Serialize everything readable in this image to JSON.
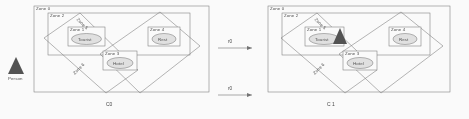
{
  "diagram": {
    "type": "state-transition-zone-diagram",
    "states": [
      {
        "id": "C0",
        "caption": "C0",
        "actor": {
          "name": "Person",
          "label": "Person",
          "icon": "triangle-person-icon",
          "location": "outside",
          "shaded": true
        },
        "zones": [
          {
            "id": "zone0",
            "label": "Zone 0",
            "shape": "rectangle",
            "role": "outer-container"
          },
          {
            "id": "zone2",
            "label": "Zone 2",
            "shape": "rectangle",
            "role": "inner-container"
          },
          {
            "id": "zone5",
            "label": "Zone 5",
            "shape": "diamond",
            "role": "rotated-region"
          },
          {
            "id": "zone6",
            "label": "Zone 6",
            "shape": "diamond",
            "role": "rotated-region"
          },
          {
            "id": "zone1",
            "label": "Zone 1",
            "shape": "rectangle",
            "entity": "Tourist"
          },
          {
            "id": "zone4",
            "label": "Zone 4",
            "shape": "rectangle",
            "entity": "Rest"
          },
          {
            "id": "zone3",
            "label": "Zone 3",
            "shape": "rectangle",
            "entity": "Hotel"
          }
        ],
        "entities": [
          {
            "id": "tourist",
            "label": "Tourist",
            "shape": "ellipse",
            "zone": "Zone 1"
          },
          {
            "id": "rest",
            "label": "Rest",
            "shape": "ellipse",
            "zone": "Zone 4"
          },
          {
            "id": "hotel",
            "label": "Hotel",
            "shape": "ellipse",
            "zone": "Zone 3"
          }
        ]
      },
      {
        "id": "C1",
        "caption": "C 1",
        "actor": {
          "name": "Person",
          "label": "Person",
          "icon": "triangle-person-icon",
          "location": "Zone 1 / Tourist",
          "shaded": true
        },
        "zones": [
          {
            "id": "zone0",
            "label": "Zone 0",
            "shape": "rectangle",
            "role": "outer-container"
          },
          {
            "id": "zone2",
            "label": "Zone 2",
            "shape": "rectangle",
            "role": "inner-container"
          },
          {
            "id": "zone5",
            "label": "Zone 5",
            "shape": "diamond",
            "role": "rotated-region"
          },
          {
            "id": "zone6",
            "label": "Zone 6",
            "shape": "diamond",
            "role": "rotated-region"
          },
          {
            "id": "zone1",
            "label": "Zone 1",
            "shape": "rectangle",
            "entity": "Tourist"
          },
          {
            "id": "zone4",
            "label": "Zone 4",
            "shape": "rectangle",
            "entity": "Rest"
          },
          {
            "id": "zone3",
            "label": "Zone 3",
            "shape": "rectangle",
            "entity": "Hotel"
          }
        ],
        "entities": [
          {
            "id": "tourist",
            "label": "Tourist",
            "shape": "ellipse",
            "zone": "Zone 1"
          },
          {
            "id": "rest",
            "label": "Rest",
            "shape": "ellipse",
            "zone": "Zone 4"
          },
          {
            "id": "hotel",
            "label": "Hotel",
            "shape": "ellipse",
            "zone": "Zone 3"
          }
        ]
      }
    ],
    "transitions": [
      {
        "id": "r0-top",
        "label": "r0",
        "from": "C0",
        "to": "C1",
        "direction": "right"
      },
      {
        "id": "r0-bottom",
        "label": "r0",
        "from": "C0",
        "to": "C1",
        "direction": "right"
      }
    ],
    "colors": {
      "stroke": "#6e6e6e",
      "fill": "#ffffff",
      "ellipse_fill": "#e8e8e8",
      "actor_fill": "#4a4a4a",
      "text": "#3d3d3d"
    }
  }
}
